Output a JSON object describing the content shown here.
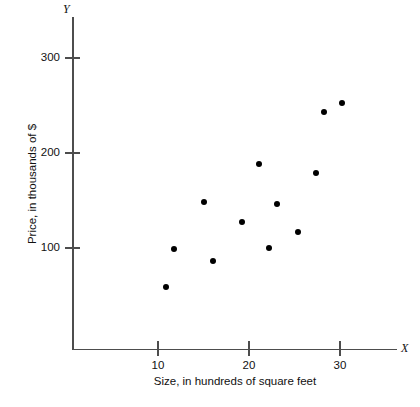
{
  "chart_data": {
    "type": "scatter",
    "title": "",
    "xlabel": "Size, in hundreds of square feet",
    "ylabel": "Price, in thousands of $",
    "x_axis_letter": "X",
    "y_axis_letter": "Y",
    "xlim": [
      7.0,
      32.5
    ],
    "ylim": [
      0,
      330
    ],
    "xticks": [
      10,
      20,
      30
    ],
    "xtick_labels": [
      "10",
      "20",
      "30"
    ],
    "yticks": [
      100,
      200,
      300
    ],
    "ytick_labels": [
      "100",
      "200",
      "300"
    ],
    "grid": false,
    "legend": null,
    "marker_color": "#000000",
    "axis_color": "#4d4d4d",
    "points": [
      {
        "x": 10.9,
        "y": 59
      },
      {
        "x": 11.8,
        "y": 99
      },
      {
        "x": 15.0,
        "y": 148
      },
      {
        "x": 16.0,
        "y": 86
      },
      {
        "x": 19.2,
        "y": 127
      },
      {
        "x": 21.1,
        "y": 188
      },
      {
        "x": 22.2,
        "y": 100
      },
      {
        "x": 23.1,
        "y": 146
      },
      {
        "x": 25.4,
        "y": 117
      },
      {
        "x": 27.4,
        "y": 179
      },
      {
        "x": 28.2,
        "y": 243
      },
      {
        "x": 30.2,
        "y": 253
      }
    ]
  }
}
